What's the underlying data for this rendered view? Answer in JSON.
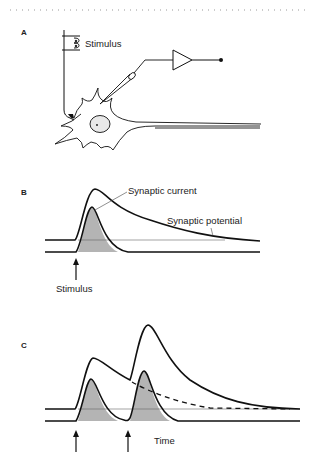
{
  "panels": {
    "a": {
      "label": "A",
      "stimulus_label": "Stimulus",
      "elements": [
        "stimulus-electrode",
        "recording-electrode",
        "amplifier",
        "neuron-soma",
        "nucleus",
        "axon",
        "presynaptic-terminal"
      ]
    },
    "b": {
      "label": "B",
      "current_label": "Synaptic current",
      "potential_label": "Synaptic potential",
      "stimulus_label": "Stimulus"
    },
    "c": {
      "label": "C",
      "time_label": "Time"
    }
  },
  "colors": {
    "line": "#111111",
    "fill": "#b4b4b4",
    "thin": "#555555"
  }
}
